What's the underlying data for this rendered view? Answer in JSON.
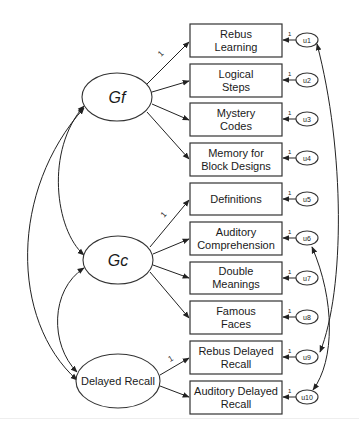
{
  "diagram": {
    "type": "structural-equation-model",
    "latent_factors": [
      {
        "id": "gf",
        "label": "Gf",
        "italic": true
      },
      {
        "id": "gc",
        "label": "Gc",
        "italic": true
      },
      {
        "id": "dr",
        "label": "Delayed Recall",
        "italic": false
      }
    ],
    "indicators": [
      {
        "id": "rl",
        "line1": "Rebus",
        "line2": "Learning",
        "factor": "gf",
        "error": "u1"
      },
      {
        "id": "ls",
        "line1": "Logical",
        "line2": "Steps",
        "factor": "gf",
        "error": "u2"
      },
      {
        "id": "mc",
        "line1": "Mystery",
        "line2": "Codes",
        "factor": "gf",
        "error": "u3"
      },
      {
        "id": "mbd",
        "line1": "Memory for",
        "line2": "Block Designs",
        "factor": "gf",
        "error": "u4"
      },
      {
        "id": "def",
        "line1": "Definitions",
        "line2": "",
        "factor": "gc",
        "error": "u5"
      },
      {
        "id": "ac",
        "line1": "Auditory",
        "line2": "Comprehension",
        "factor": "gc",
        "error": "u6"
      },
      {
        "id": "dm",
        "line1": "Double",
        "line2": "Meanings",
        "factor": "gc",
        "error": "u7"
      },
      {
        "id": "ff",
        "line1": "Famous",
        "line2": "Faces",
        "factor": "gc",
        "error": "u8"
      },
      {
        "id": "rdr",
        "line1": "Rebus Delayed",
        "line2": "Recall",
        "factor": "dr",
        "error": "u9"
      },
      {
        "id": "adr",
        "line1": "Auditory Delayed",
        "line2": "Recall",
        "factor": "dr",
        "error": "u10"
      }
    ],
    "errors": [
      "u1",
      "u2",
      "u3",
      "u4",
      "u5",
      "u6",
      "u7",
      "u8",
      "u9",
      "u10"
    ],
    "fixed_loading_label": "1",
    "error_path_label": "1",
    "covariances": [
      [
        "gf",
        "gc"
      ],
      [
        "gf",
        "dr"
      ],
      [
        "gc",
        "dr"
      ],
      [
        "u1",
        "u9"
      ],
      [
        "u6",
        "u10"
      ]
    ]
  }
}
